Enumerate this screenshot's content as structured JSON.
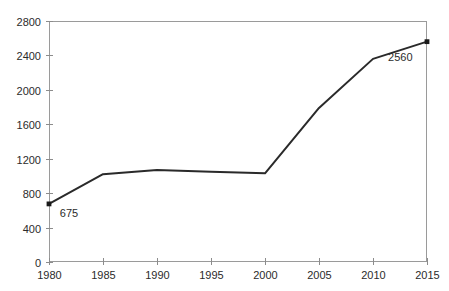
{
  "chart_data": {
    "type": "line",
    "title": "",
    "subtitle": "",
    "xlabel": "",
    "ylabel": "",
    "x": [
      1980,
      1985,
      1990,
      1995,
      2000,
      2005,
      2010,
      2015
    ],
    "categories": [
      "1980",
      "1985",
      "1990",
      "1995",
      "2000",
      "2005",
      "2010",
      "2015"
    ],
    "values": [
      675,
      1020,
      1070,
      1050,
      1030,
      1790,
      2360,
      2560
    ],
    "series": [
      {
        "name": "",
        "values": [
          675,
          1020,
          1070,
          1050,
          1030,
          1790,
          2360,
          2560
        ]
      }
    ],
    "xlim": [
      1980,
      2015
    ],
    "ylim": [
      0,
      2800
    ],
    "xticks": [
      1980,
      1985,
      1990,
      1995,
      2000,
      2005,
      2010,
      2015
    ],
    "yticks": [
      0,
      400,
      800,
      1200,
      1600,
      2000,
      2400,
      2800
    ],
    "xtick_labels": [
      "1980",
      "1985",
      "1990",
      "1995",
      "2000",
      "2005",
      "2010",
      "2015"
    ],
    "ytick_labels": [
      "0",
      "400",
      "800",
      "1200",
      "1600",
      "2000",
      "2400",
      "2800"
    ],
    "grid": false,
    "legend": false,
    "legend_position": "none",
    "annotations": [
      {
        "text": "675",
        "x": 1980,
        "y": 675,
        "label_x": 1981.0,
        "label_y": 520
      },
      {
        "text": "2560",
        "x": 2015,
        "y": 2560,
        "label_x": 2011.4,
        "label_y": 2340
      }
    ],
    "markers": [
      {
        "x": 1980,
        "y": 675
      },
      {
        "x": 2015,
        "y": 2560
      }
    ],
    "colors": {
      "line": "#2a2a2a",
      "marker": "#1a1a1a",
      "frame": "#9a9a9a",
      "tick": "#8c8c8c",
      "text": "#2b2b2b",
      "background": "#ffffff"
    }
  },
  "plot_area": {
    "left": 49,
    "top": 21,
    "right": 427,
    "bottom": 262
  }
}
